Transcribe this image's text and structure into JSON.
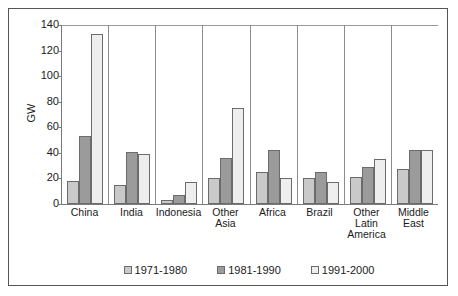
{
  "chart_data": {
    "type": "bar",
    "title": "",
    "xlabel": "",
    "ylabel": "GW",
    "ylim": [
      0,
      140
    ],
    "ytick_step": 20,
    "yticks": [
      "140",
      "120",
      "100",
      "80",
      "60",
      "40",
      "20",
      "0"
    ],
    "grid": false,
    "legend_position": "bottom",
    "categories": [
      "China",
      "India",
      "Indonesia",
      "Other\nAsia",
      "Africa",
      "Brazil",
      "Other\nLatin\nAmerica",
      "Middle\nEast"
    ],
    "series": [
      {
        "name": "1971-1980",
        "color": "#c9c9c9",
        "values": [
          18,
          15,
          3,
          20,
          25,
          20,
          21,
          27
        ]
      },
      {
        "name": "1981-1990",
        "color": "#9b9b9b",
        "values": [
          53,
          41,
          7,
          36,
          42,
          25,
          29,
          42
        ]
      },
      {
        "name": "1991-2000",
        "color": "#eeeeee",
        "values": [
          133,
          39,
          17,
          75,
          20,
          17,
          35,
          42
        ]
      }
    ]
  }
}
